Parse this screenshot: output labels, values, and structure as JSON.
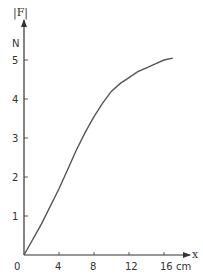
{
  "chart_data": {
    "type": "line",
    "title": "",
    "xlabel": "x",
    "x_unit": "cm",
    "ylabel": "|F|",
    "y_unit": "N",
    "xlim": [
      0,
      18
    ],
    "ylim": [
      0,
      5.5
    ],
    "grid": false,
    "legend": null,
    "x_ticks": [
      0,
      4,
      8,
      12,
      16
    ],
    "x_tick_labels": [
      "0",
      "4",
      "8",
      "12",
      "16 cm"
    ],
    "y_ticks": [
      1,
      2,
      3,
      4,
      5
    ],
    "y_tick_labels": [
      "1",
      "2",
      "3",
      "4",
      "5"
    ],
    "series": [
      {
        "name": "|F|",
        "color": "#555555",
        "x": [
          0,
          2,
          4,
          5,
          6,
          7,
          8,
          9,
          10,
          11,
          12,
          13,
          14,
          15,
          16,
          17
        ],
        "y": [
          0,
          0.8,
          1.7,
          2.2,
          2.7,
          3.15,
          3.55,
          3.9,
          4.2,
          4.4,
          4.55,
          4.7,
          4.8,
          4.9,
          5.0,
          5.05
        ]
      }
    ]
  },
  "labels": {
    "y_axis_title": "|F|",
    "y_unit": "N",
    "x_axis_title": "x",
    "origin": "0"
  },
  "colors": {
    "axis": "#333333",
    "curve": "#555555"
  }
}
